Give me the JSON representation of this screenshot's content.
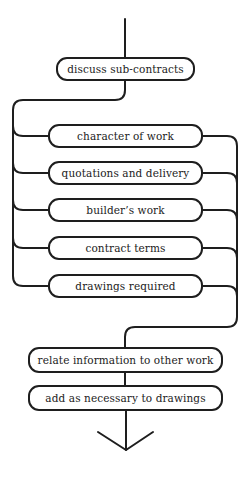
{
  "diagram": {
    "start_box": {
      "label": "discuss sub-contracts"
    },
    "parallel_boxes": [
      {
        "label": "character of work"
      },
      {
        "label": "quotations and delivery"
      },
      {
        "label": "builder’s work"
      },
      {
        "label": "contract terms"
      },
      {
        "label": "drawings required"
      }
    ],
    "end_boxes": [
      {
        "label": "relate information to other work"
      },
      {
        "label": "add as necessary to drawings"
      }
    ],
    "colors": {
      "line": "#1e1e1e",
      "text": "#222222",
      "background": "#ffffff"
    }
  }
}
